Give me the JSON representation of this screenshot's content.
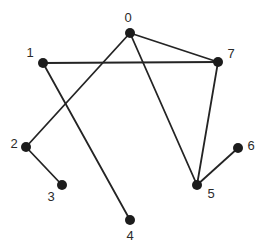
{
  "diagram": {
    "title": "",
    "type": "undirected-graph",
    "background_color": "#ffffff",
    "node_color": "#1c1c1c",
    "edge_color": "#242424",
    "label_color": "#2a2a2a",
    "node_radius": 5,
    "edge_width": 1.8,
    "nodes": [
      {
        "id": "0",
        "label": "0",
        "x": 130,
        "y": 33,
        "label_dx": -2,
        "label_dy": -11
      },
      {
        "id": "1",
        "label": "1",
        "x": 43,
        "y": 63,
        "label_dx": -13,
        "label_dy": -6
      },
      {
        "id": "2",
        "label": "2",
        "x": 26,
        "y": 147,
        "label_dx": -12,
        "label_dy": 1
      },
      {
        "id": "3",
        "label": "3",
        "x": 62,
        "y": 185,
        "label_dx": -11,
        "label_dy": 16
      },
      {
        "id": "4",
        "label": "4",
        "x": 130,
        "y": 220,
        "label_dx": 0,
        "label_dy": 20
      },
      {
        "id": "5",
        "label": "5",
        "x": 197,
        "y": 185,
        "label_dx": 14,
        "label_dy": 13
      },
      {
        "id": "6",
        "label": "6",
        "x": 238,
        "y": 148,
        "label_dx": 13,
        "label_dy": 2
      },
      {
        "id": "7",
        "label": "7",
        "x": 218,
        "y": 62,
        "label_dx": 13,
        "label_dy": -4
      }
    ],
    "edges": [
      {
        "source": "0",
        "target": "7"
      },
      {
        "source": "1",
        "target": "7"
      },
      {
        "source": "5",
        "target": "7"
      },
      {
        "source": "0",
        "target": "5"
      },
      {
        "source": "0",
        "target": "2"
      },
      {
        "source": "1",
        "target": "4"
      },
      {
        "source": "2",
        "target": "3"
      },
      {
        "source": "5",
        "target": "6"
      }
    ]
  }
}
